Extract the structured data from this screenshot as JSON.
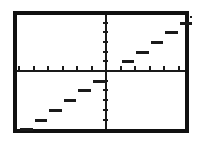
{
  "app": {
    "title": "Graphing Calculator Screen",
    "screen_label": "graph-display"
  },
  "chart_data": {
    "type": "line",
    "title": "",
    "subtitle": "",
    "xlabel": "",
    "ylabel": "",
    "function": "step function (greatest integer / floor)",
    "grid": false,
    "legend": false,
    "legend_position": "none",
    "axes": {
      "x_axis_visible": true,
      "y_axis_visible": true,
      "origin_px": {
        "x": 89,
        "y": 56
      },
      "xlim": [
        -6,
        6
      ],
      "ylim": [
        -6,
        6
      ],
      "x_tick_count": 12,
      "y_tick_count": 12,
      "x_tick_spacing_px": 14.5,
      "y_tick_spacing_px": 9.7,
      "tick_labels_shown": false
    },
    "series": [
      {
        "name": "floor(x)",
        "style": "step",
        "segments": [
          {
            "x_start": -6,
            "x_end": -5,
            "y": -6
          },
          {
            "x_start": -5,
            "x_end": -4,
            "y": -5
          },
          {
            "x_start": -4,
            "x_end": -3,
            "y": -4
          },
          {
            "x_start": -3,
            "x_end": -2,
            "y": -3
          },
          {
            "x_start": -2,
            "x_end": -1,
            "y": -2
          },
          {
            "x_start": -1,
            "x_end": 0,
            "y": -1
          },
          {
            "x_start": 1,
            "x_end": 2,
            "y": 1
          },
          {
            "x_start": 2,
            "x_end": 3,
            "y": 2
          },
          {
            "x_start": 3,
            "x_end": 4,
            "y": 3
          },
          {
            "x_start": 4,
            "x_end": 5,
            "y": 4
          },
          {
            "x_start": 5,
            "x_end": 6,
            "y": 5
          }
        ]
      }
    ],
    "annotations": [
      {
        "name": "cursor-pixel",
        "x": 5.8,
        "y": 5.7
      }
    ],
    "colors": {
      "background": "#ffffff",
      "ink": "#1a1a1a",
      "border": "#111111"
    }
  }
}
